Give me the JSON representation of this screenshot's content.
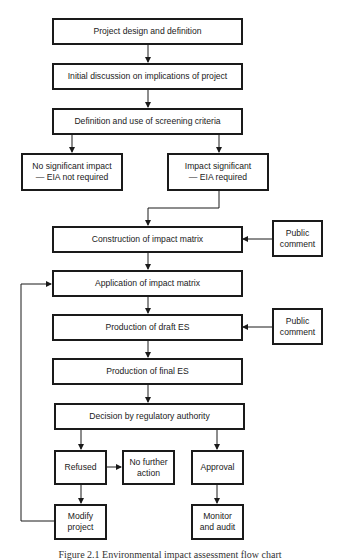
{
  "diagram": {
    "type": "flowchart",
    "nodes": {
      "project_design": "Project design and definition",
      "initial_discussion": "Initial discussion on implications of project",
      "screening_criteria": "Definition and use of screening criteria",
      "no_significant_impact": {
        "line1": "No significant impact",
        "line2": "— EIA not required"
      },
      "impact_significant": {
        "line1": "Impact significant",
        "line2": "— EIA required"
      },
      "construction_matrix": "Construction of impact matrix",
      "public_comment_1": {
        "line1": "Public",
        "line2": "comment"
      },
      "application_matrix": "Application of impact matrix",
      "draft_es": "Production of draft ES",
      "public_comment_2": {
        "line1": "Public",
        "line2": "comment"
      },
      "final_es": "Production of final ES",
      "decision": "Decision by regulatory authority",
      "refused": "Refused",
      "no_further_action": {
        "line1": "No further",
        "line2": "action"
      },
      "approval": "Approval",
      "modify_project": {
        "line1": "Modify",
        "line2": "project"
      },
      "monitor_audit": {
        "line1": "Monitor",
        "line2": "and audit"
      }
    },
    "edges": [
      [
        "project_design",
        "initial_discussion"
      ],
      [
        "initial_discussion",
        "screening_criteria"
      ],
      [
        "screening_criteria",
        "no_significant_impact"
      ],
      [
        "screening_criteria",
        "impact_significant"
      ],
      [
        "impact_significant",
        "construction_matrix"
      ],
      [
        "public_comment_1",
        "construction_matrix"
      ],
      [
        "construction_matrix",
        "application_matrix"
      ],
      [
        "application_matrix",
        "draft_es"
      ],
      [
        "public_comment_2",
        "draft_es"
      ],
      [
        "draft_es",
        "final_es"
      ],
      [
        "final_es",
        "decision"
      ],
      [
        "decision",
        "refused"
      ],
      [
        "decision",
        "approval"
      ],
      [
        "refused",
        "no_further_action"
      ],
      [
        "refused",
        "modify_project"
      ],
      [
        "modify_project",
        "application_matrix"
      ],
      [
        "approval",
        "monitor_audit"
      ]
    ],
    "caption": "Figure 2.1 Environmental impact assessment flow chart"
  },
  "colors": {
    "line": "#1a1a1a",
    "background": "#ffffff"
  }
}
